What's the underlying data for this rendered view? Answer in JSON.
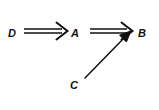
{
  "diagram": {
    "type": "implication-graph",
    "background_color": "#ffffff",
    "stroke_color": "#111111",
    "nodes": [
      {
        "id": "D",
        "label": "D",
        "x": 12,
        "y": 33
      },
      {
        "id": "A",
        "label": "A",
        "x": 75,
        "y": 33
      },
      {
        "id": "B",
        "label": "B",
        "x": 142,
        "y": 33
      },
      {
        "id": "C",
        "label": "C",
        "x": 74,
        "y": 85
      }
    ],
    "edges": [
      {
        "id": "D-to-A",
        "from": "D",
        "to": "A",
        "style": "double-line",
        "arrowhead": "open-barb",
        "x1": 24,
        "y1": 31,
        "x2": 66,
        "y2": 31
      },
      {
        "id": "A-to-B",
        "from": "A",
        "to": "B",
        "style": "double-line",
        "arrowhead": "open-barb",
        "x1": 90,
        "y1": 31,
        "x2": 132,
        "y2": 31
      },
      {
        "id": "C-to-B",
        "from": "C",
        "to": "B",
        "style": "single-line",
        "arrowhead": "solid-triangle",
        "x1": 85,
        "y1": 78,
        "x2": 130,
        "y2": 32
      }
    ]
  }
}
